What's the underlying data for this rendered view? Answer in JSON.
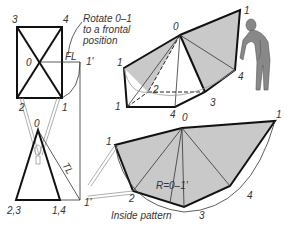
{
  "diagram": {
    "annotation": {
      "line1": "Rotate 0–1",
      "line2": "to a frontal",
      "line3": "position"
    },
    "top_view": {
      "labels": {
        "v3": "3",
        "v4": "4",
        "v0": "0",
        "v2": "2",
        "v1": "1",
        "fl": "FL",
        "v1p": "1'"
      }
    },
    "front_view": {
      "labels": {
        "v0": "0",
        "v23": "2,3",
        "v14": "1,4",
        "v1p": "1'",
        "tl": "TL"
      }
    },
    "pictorial": {
      "labels": {
        "v0": "0",
        "v1a": "1",
        "v1b": "1",
        "v1c": "1",
        "v2": "2",
        "v3": "3",
        "v4": "4"
      }
    },
    "pattern": {
      "labels": {
        "v0": "0",
        "v4top": "4",
        "v1": "1",
        "v1right": "1",
        "v2": "2",
        "v3": "3",
        "v4": "4",
        "radius": "R=0–1'"
      },
      "caption": "Inside pattern"
    },
    "figure": {
      "description": "human figure unrolling pattern"
    },
    "colors": {
      "shade": "#c9c9c9",
      "line": "#111111",
      "background": "#ffffff"
    }
  }
}
